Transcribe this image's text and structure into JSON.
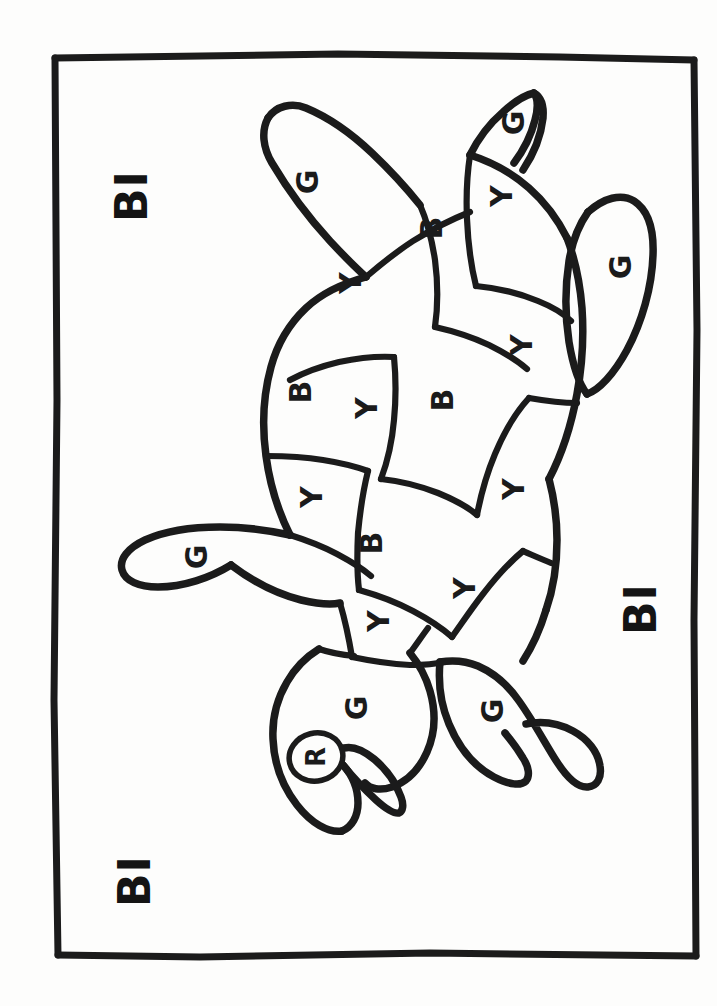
{
  "page": {
    "background_color": "#fdfdfc",
    "ink_color": "#1b1b1b",
    "orientation_note": "portrait sheet, drawing rotated 90 degrees"
  },
  "frame": {
    "name": "hand-drawn border",
    "left": 53,
    "top": 55,
    "right": 695,
    "bottom": 958
  },
  "corner_labels": [
    {
      "id": "top-left",
      "text": "BI",
      "x": 131,
      "y": 196,
      "rotation": -90
    },
    {
      "id": "right-middle",
      "text": "BI",
      "x": 640,
      "y": 609,
      "rotation": -90
    },
    {
      "id": "bottom-left",
      "text": "BI",
      "x": 134,
      "y": 881,
      "rotation": -90
    }
  ],
  "legend_keys": [
    {
      "letter": "G",
      "meaning": "Green",
      "color": "#2e9e4f"
    },
    {
      "letter": "Y",
      "meaning": "Yellow",
      "color": "#f2c230"
    },
    {
      "letter": "B",
      "meaning": "Blue",
      "color": "#2a64b4"
    },
    {
      "letter": "R",
      "meaning": "Red",
      "color": "#d2342c"
    }
  ],
  "regions": [
    {
      "id": "front-left-flipper",
      "part": "flipper",
      "letter": "G",
      "x": 307,
      "y": 182,
      "rotation": -90
    },
    {
      "id": "head-tip",
      "part": "head",
      "letter": "G",
      "x": 513,
      "y": 123,
      "rotation": -90
    },
    {
      "id": "shell-plate-1",
      "part": "shell",
      "letter": "Y",
      "x": 350,
      "y": 283,
      "rotation": -90
    },
    {
      "id": "shell-plate-2",
      "part": "shell",
      "letter": "B",
      "x": 431,
      "y": 228,
      "rotation": -90
    },
    {
      "id": "shell-plate-3",
      "part": "shell",
      "letter": "Y",
      "x": 501,
      "y": 196,
      "rotation": -90
    },
    {
      "id": "rear-right-flipper",
      "part": "flipper",
      "letter": "G",
      "x": 620,
      "y": 267,
      "rotation": -90
    },
    {
      "id": "shell-plate-4",
      "part": "shell",
      "letter": "Y",
      "x": 521,
      "y": 345,
      "rotation": -90
    },
    {
      "id": "shell-plate-5",
      "part": "shell",
      "letter": "B",
      "x": 300,
      "y": 392,
      "rotation": -90
    },
    {
      "id": "shell-plate-6",
      "part": "shell",
      "letter": "Y",
      "x": 366,
      "y": 408,
      "rotation": -90
    },
    {
      "id": "shell-plate-7",
      "part": "shell",
      "letter": "B",
      "x": 442,
      "y": 400,
      "rotation": -90
    },
    {
      "id": "shell-plate-8",
      "part": "shell",
      "letter": "Y",
      "x": 513,
      "y": 489,
      "rotation": -90
    },
    {
      "id": "shell-plate-9",
      "part": "shell",
      "letter": "Y",
      "x": 311,
      "y": 497,
      "rotation": -90
    },
    {
      "id": "shell-plate-10",
      "part": "shell",
      "letter": "B",
      "x": 371,
      "y": 543,
      "rotation": -90
    },
    {
      "id": "shell-plate-11",
      "part": "shell",
      "letter": "Y",
      "x": 464,
      "y": 588,
      "rotation": -90
    },
    {
      "id": "shell-plate-12",
      "part": "shell",
      "letter": "Y",
      "x": 378,
      "y": 621,
      "rotation": -90
    },
    {
      "id": "front-right-flipper",
      "part": "flipper",
      "letter": "G",
      "x": 196,
      "y": 557,
      "rotation": -90
    },
    {
      "id": "head-body",
      "part": "head",
      "letter": "G",
      "x": 356,
      "y": 708,
      "rotation": -90
    },
    {
      "id": "head-eye",
      "part": "eye",
      "letter": "R",
      "x": 316,
      "y": 757,
      "rotation": -90
    },
    {
      "id": "rear-left-flipper",
      "part": "flipper",
      "letter": "G",
      "x": 492,
      "y": 711,
      "rotation": -90
    }
  ]
}
